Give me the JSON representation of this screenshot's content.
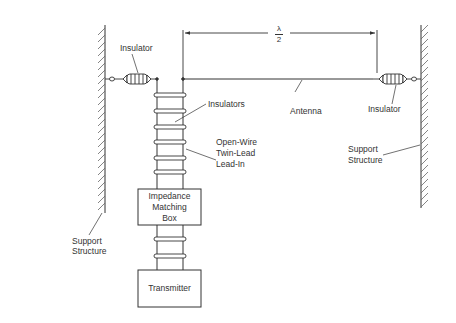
{
  "diagram": {
    "type": "half-wave dipole antenna installation",
    "labels": {
      "insulator_left": "Insulator",
      "insulator_right": "Insulator",
      "insulators": "Insulators",
      "antenna": "Antenna",
      "lead_in_line1": "Open-Wire",
      "lead_in_line2": "Twin-Lead",
      "lead_in_line3": "Lead-In",
      "support_left_line1": "Support",
      "support_left_line2": "Structure",
      "support_right_line1": "Support",
      "support_right_line2": "Structure",
      "dimension_numerator": "λ",
      "dimension_denominator": "2"
    },
    "boxes": {
      "impedance_line1": "Impedance",
      "impedance_line2": "Matching",
      "impedance_line3": "Box",
      "transmitter": "Transmitter"
    },
    "colors": {
      "line": "#333333",
      "hatch": "#555555",
      "background": "#ffffff"
    }
  }
}
